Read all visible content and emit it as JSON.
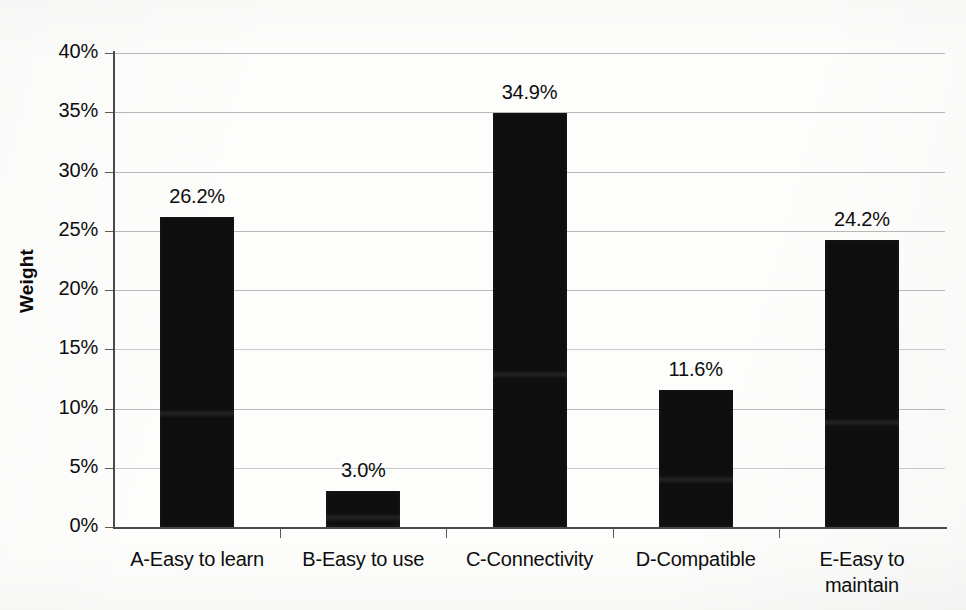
{
  "chart_data": {
    "type": "bar",
    "title": "",
    "subtitle": "",
    "xlabel": "",
    "ylabel": "Weight",
    "categories": [
      "A-Easy to learn",
      "B-Easy to use",
      "C-Connectivity",
      "D-Compatible",
      "E-Easy to\nmaintain"
    ],
    "values": [
      26.2,
      3.0,
      34.9,
      11.6,
      24.2
    ],
    "value_labels": [
      "26.2%",
      "3.0%",
      "34.9%",
      "11.6%",
      "24.2%"
    ],
    "ylim": [
      0,
      40
    ],
    "ytick_values": [
      0,
      5,
      10,
      15,
      20,
      25,
      30,
      35,
      40
    ],
    "ytick_labels": [
      "0%",
      "5%",
      "10%",
      "15%",
      "20%",
      "25%",
      "30%",
      "35%",
      "40%"
    ],
    "grid": true,
    "grid_axis": "y",
    "legend": false,
    "legend_position": "none",
    "bar_color": "#0e0e0e",
    "gridline_color": "#b9b9b9",
    "axis_color": "#4a4a4a",
    "background_color": "#fdfdfc",
    "text_color": "#0d0d0d",
    "series": [
      {
        "name": "Weight",
        "values": [
          26.2,
          3.0,
          34.9,
          11.6,
          24.2
        ]
      }
    ]
  }
}
